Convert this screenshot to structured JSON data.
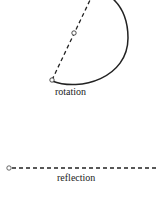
{
  "diagram": {
    "panels": [
      {
        "id": "rotation",
        "label": "rotation"
      },
      {
        "id": "reflection",
        "label": "reflection"
      }
    ],
    "colors": {
      "stroke": "#222222",
      "background": "#ffffff"
    }
  }
}
